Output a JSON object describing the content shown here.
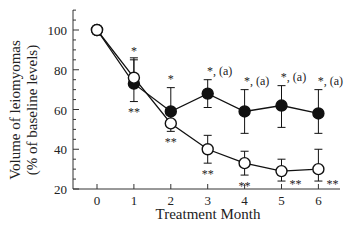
{
  "chart_data": {
    "type": "line",
    "title": "",
    "xlabel": "Treatment Month",
    "ylabel_line1": "Volume of leiomyomas",
    "ylabel_line2": "(% of baseline levels)",
    "x": [
      0,
      1,
      2,
      3,
      4,
      5,
      6
    ],
    "x_tick_labels": [
      "0",
      "1",
      "2",
      "3",
      "4",
      "5",
      "6"
    ],
    "y_tick_labels": [
      "20",
      "40",
      "60",
      "80",
      "100"
    ],
    "ylim": [
      20,
      110
    ],
    "xlim": [
      -0.6,
      6.6
    ],
    "grid": false,
    "series": [
      {
        "name": "filled-circles",
        "marker": "filled",
        "values": [
          100,
          73,
          59,
          68,
          59,
          62,
          58
        ],
        "err_low": [
          0,
          9,
          7,
          7,
          11,
          11,
          10
        ],
        "err_high": [
          0,
          12,
          12,
          7,
          11,
          10,
          12
        ],
        "annotations_above": [
          "",
          "*",
          "*",
          "*, (a)",
          "*, (a)",
          "*, (a)",
          "*, (a)"
        ]
      },
      {
        "name": "open-circles",
        "marker": "open",
        "values": [
          100,
          76,
          53,
          40,
          33,
          29,
          30
        ],
        "err_low": [
          0,
          0,
          4,
          7,
          6,
          5,
          6
        ],
        "err_high": [
          0,
          10,
          0,
          7,
          6,
          6,
          10
        ],
        "annotations_below": [
          "",
          "**",
          "**",
          "**",
          "**",
          "**",
          "**"
        ]
      }
    ]
  }
}
